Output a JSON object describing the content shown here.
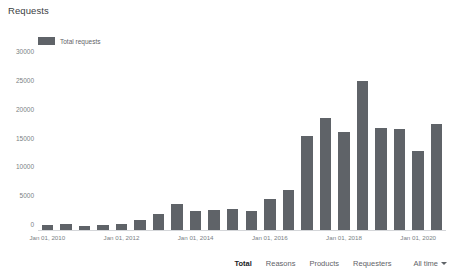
{
  "page_title": "Requests",
  "legend": {
    "items": [
      {
        "label": "Total requests",
        "color": "#5f6368"
      }
    ]
  },
  "toolbar": {
    "items": [
      {
        "label": "Total",
        "active": true
      },
      {
        "label": "Reasons",
        "active": false
      },
      {
        "label": "Products",
        "active": false
      },
      {
        "label": "Requesters",
        "active": false
      }
    ],
    "range_label": "All time",
    "caret_icon": "chevron-down-icon"
  },
  "chart_data": {
    "type": "bar",
    "title": "Requests",
    "xlabel": "",
    "ylabel": "",
    "ylim": [
      0,
      30000
    ],
    "yticks": [
      0,
      5000,
      10000,
      15000,
      20000,
      25000,
      30000
    ],
    "ytick_labels": [
      "0",
      "5000",
      "10000",
      "15000",
      "20000",
      "25000",
      "30000"
    ],
    "grid": false,
    "legend_position": "top-left",
    "bar_color": "#5f6368",
    "categories": [
      "Jan 01, 2010",
      "Jul 01, 2010",
      "Jan 01, 2011",
      "Jul 01, 2011",
      "Jan 01, 2012",
      "Jul 01, 2012",
      "Jan 01, 2013",
      "Jul 01, 2013",
      "Jan 01, 2014",
      "Jul 01, 2014",
      "Jan 01, 2015",
      "Jul 01, 2015",
      "Jan 01, 2016",
      "Jul 01, 2016",
      "Jan 01, 2017",
      "Jul 01, 2017",
      "Jan 01, 2018",
      "Jul 01, 2018",
      "Jan 01, 2019",
      "Jul 01, 2019",
      "Jan 01, 2020",
      "Jul 01, 2020"
    ],
    "values": [
      1100,
      1300,
      900,
      1000,
      1200,
      1900,
      3000,
      4600,
      3500,
      3700,
      3800,
      3500,
      5600,
      7100,
      16400,
      19600,
      17100,
      26000,
      17900,
      17700,
      13800,
      18500
    ],
    "xtick_labels": [
      "Jan 01, 2010",
      "Jan 01, 2012",
      "Jan 01, 2014",
      "Jan 01, 2016",
      "Jan 01, 2018",
      "Jan 01, 2020"
    ],
    "xtick_indices": [
      0,
      4,
      8,
      12,
      16,
      20
    ]
  }
}
